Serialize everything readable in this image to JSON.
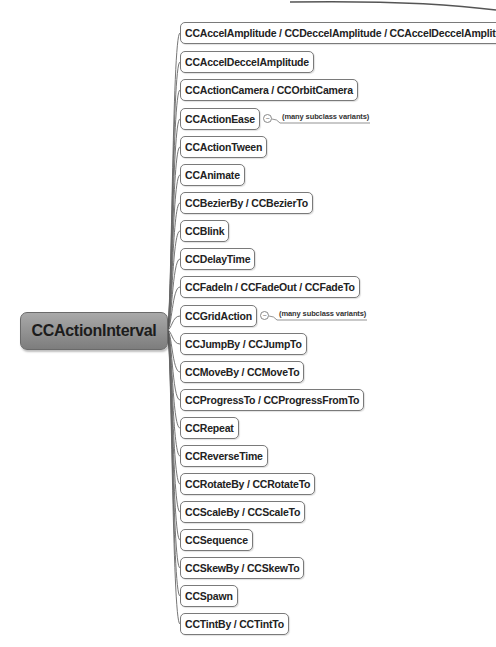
{
  "root": {
    "label": "CCActionInterval",
    "fill": "#8f8f8f"
  },
  "children": [
    {
      "label": "CCAccelAmplitude / CCDeccelAmplitude / CCAccelDeccelAmplitude"
    },
    {
      "label": "CCAccelDeccelAmplitude"
    },
    {
      "label": "CCActionCamera / CCOrbitCamera"
    },
    {
      "label": "CCActionEase",
      "note": "(many subclass variants)"
    },
    {
      "label": "CCActionTween"
    },
    {
      "label": "CCAnimate"
    },
    {
      "label": "CCBezierBy / CCBezierTo"
    },
    {
      "label": "CCBlink"
    },
    {
      "label": "CCDelayTime"
    },
    {
      "label": "CCFadeIn / CCFadeOut / CCFadeTo"
    },
    {
      "label": "CCGridAction",
      "note": "(many subclass variants)"
    },
    {
      "label": "CCJumpBy / CCJumpTo"
    },
    {
      "label": "CCMoveBy / CCMoveTo"
    },
    {
      "label": "CCProgressTo / CCProgressFromTo"
    },
    {
      "label": "CCRepeat"
    },
    {
      "label": "CCReverseTime"
    },
    {
      "label": "CCRotateBy / CCRotateTo"
    },
    {
      "label": "CCScaleBy / CCScaleTo"
    },
    {
      "label": "CCSequence"
    },
    {
      "label": "CCSkewBy / CCSkewTo"
    },
    {
      "label": "CCSpawn"
    },
    {
      "label": "CCTintBy / CCTintTo"
    }
  ]
}
